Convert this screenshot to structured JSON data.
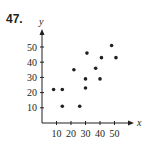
{
  "problem_number": "47.",
  "chart_data": {
    "type": "scatter",
    "title": "",
    "xlabel": "x",
    "ylabel": "y",
    "xlim": [
      0,
      55
    ],
    "ylim": [
      0,
      58
    ],
    "x_ticks": [
      10,
      20,
      30,
      40,
      50
    ],
    "y_ticks": [
      10,
      20,
      30,
      40,
      50
    ],
    "grid": false,
    "legend": null,
    "points": [
      {
        "x": 8,
        "y": 22
      },
      {
        "x": 14,
        "y": 22
      },
      {
        "x": 14,
        "y": 11
      },
      {
        "x": 22,
        "y": 35
      },
      {
        "x": 26,
        "y": 11
      },
      {
        "x": 30,
        "y": 29
      },
      {
        "x": 30,
        "y": 23
      },
      {
        "x": 31,
        "y": 46
      },
      {
        "x": 37,
        "y": 36
      },
      {
        "x": 41,
        "y": 43
      },
      {
        "x": 40,
        "y": 29
      },
      {
        "x": 48,
        "y": 51
      },
      {
        "x": 51,
        "y": 43
      }
    ]
  },
  "colors": {
    "ink": "#231f20",
    "background": "#ffffff"
  }
}
